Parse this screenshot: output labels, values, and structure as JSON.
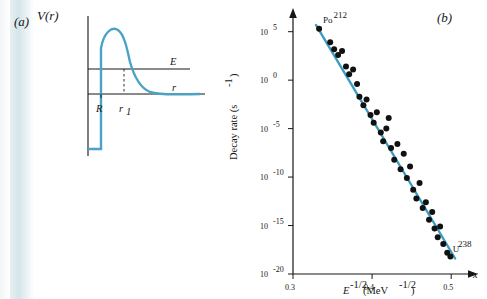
{
  "figure": {
    "panel_a": {
      "label": "(a)",
      "y_axis_label": "V(r)",
      "x_axis_label": "r",
      "energy_level_label": "E",
      "radius_label": "R",
      "turning_point_label": "r",
      "turning_point_sub": "1"
    },
    "panel_b": {
      "label": "(b)",
      "x_axis_symbol": "x"
    }
  },
  "chart_data": {
    "type": "scatter",
    "title": "",
    "xlabel": "E^-1/2 (MeV^-1/2)",
    "xlabel_parts": {
      "base": "E",
      "sup": "-1/2",
      "unit": "(MeV",
      "unit_sup": "-1/2",
      "unit_close": ")"
    },
    "ylabel": "Decay rate (s^-1)",
    "ylabel_parts": {
      "base": "Decay rate (s",
      "sup": "-1",
      "close": ")"
    },
    "xlim": [
      0.3,
      0.52
    ],
    "ylim_log10": [
      -20,
      6
    ],
    "x_ticks": [
      0.3,
      0.4,
      0.5
    ],
    "x_tick_labels": [
      "0.3",
      "0.4",
      "0.5"
    ],
    "y_ticks_log10": [
      5,
      0,
      -5,
      -10,
      -15,
      -20
    ],
    "y_tick_labels": [
      "10^5",
      "10^0",
      "10^-5",
      "10^-10",
      "10^-15",
      "10^-20"
    ],
    "y_tick_mantissa": "10",
    "y_tick_exponents": [
      "5",
      "0",
      "-5",
      "-10",
      "-15",
      "-20"
    ],
    "grid": false,
    "legend": "none",
    "annotations": [
      {
        "text": "Po",
        "sup": "212",
        "x": 0.333,
        "y_log10": 5.6
      },
      {
        "text": "U",
        "sup": "238",
        "x": 0.497,
        "y_log10": -18.0
      }
    ],
    "fit_line": {
      "color": "#3d9dc0",
      "points": [
        [
          0.329,
          5.7
        ],
        [
          0.505,
          -18.4
        ]
      ]
    },
    "points": [
      [
        0.333,
        5.3
      ],
      [
        0.347,
        3.9
      ],
      [
        0.352,
        3.2
      ],
      [
        0.357,
        2.6
      ],
      [
        0.362,
        3.0
      ],
      [
        0.367,
        1.4
      ],
      [
        0.371,
        0.6
      ],
      [
        0.376,
        1.1
      ],
      [
        0.381,
        -0.4
      ],
      [
        0.384,
        -1.7
      ],
      [
        0.389,
        -2.6
      ],
      [
        0.393,
        -2.0
      ],
      [
        0.398,
        -3.6
      ],
      [
        0.402,
        -4.4
      ],
      [
        0.406,
        -3.3
      ],
      [
        0.411,
        -5.4
      ],
      [
        0.414,
        -6.3
      ],
      [
        0.418,
        -5.0
      ],
      [
        0.421,
        -3.9
      ],
      [
        0.424,
        -7.0
      ],
      [
        0.428,
        -8.2
      ],
      [
        0.432,
        -6.6
      ],
      [
        0.436,
        -9.2
      ],
      [
        0.44,
        -7.6
      ],
      [
        0.444,
        -10.1
      ],
      [
        0.448,
        -8.9
      ],
      [
        0.452,
        -11.3
      ],
      [
        0.456,
        -12.2
      ],
      [
        0.46,
        -10.6
      ],
      [
        0.464,
        -13.2
      ],
      [
        0.468,
        -12.6
      ],
      [
        0.472,
        -14.4
      ],
      [
        0.476,
        -13.6
      ],
      [
        0.479,
        -15.3
      ],
      [
        0.483,
        -16.2
      ],
      [
        0.486,
        -15.1
      ],
      [
        0.49,
        -16.9
      ],
      [
        0.495,
        -17.8
      ],
      [
        0.499,
        -18.2
      ]
    ],
    "point_color": "#111111",
    "point_size": 3
  }
}
